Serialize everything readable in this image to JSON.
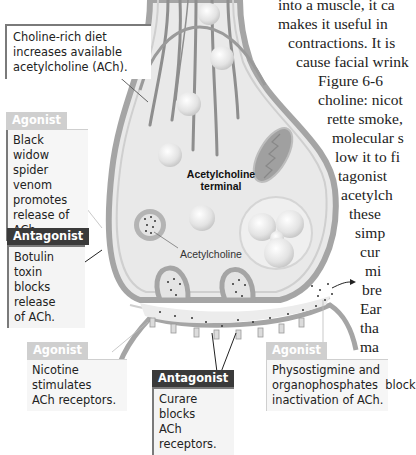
{
  "body_text": {
    "lines": [
      "into a muscle, it ca",
      "makes it useful in",
      "contractions. It is",
      "cause facial wrink",
      "Figure 6-6",
      "choline: nicot",
      "rette smoke,",
      "molecular s",
      "low it to fi",
      "tagonist",
      "acetylch",
      "these",
      "simp",
      "cur",
      "mi",
      "bre",
      "Ear",
      "tha",
      "ma"
    ]
  },
  "figure": {
    "terminal_label": "Acetylcholine terminal",
    "terminal_label_line1": "Acetylcholine",
    "terminal_label_line2": "terminal",
    "vesicle_label": "Acetylcholine",
    "colors": {
      "membrane": "#a9a9a9",
      "cytoplasm": "#e6e6e6",
      "mitochondria": "#9d9d9d",
      "antagonist_tag": "#3a3a3a",
      "agonist_tag": "#cfcfcf"
    }
  },
  "callouts": {
    "choline_diet": {
      "text": "Choline-rich diet increases available acetylcholine (ACh)."
    },
    "black_widow": {
      "tag": "Agonist",
      "line1": "Black widow",
      "line2": "spider venom",
      "line3": "promotes",
      "line4": "release of ACh."
    },
    "botulin": {
      "tag": "Antagonist",
      "line1": "Botulin toxin",
      "line2": "blocks release",
      "line3": "of ACh."
    },
    "nicotine": {
      "tag": "Agonist",
      "line1": "Nicotine stimulates",
      "line2": "ACh receptors."
    },
    "curare": {
      "tag": "Antagonist",
      "line1": "Curare blocks",
      "line2": "ACh receptors."
    },
    "physostigmine": {
      "tag": "Agonist",
      "line1": "Physostigmine and",
      "line2": "organophosphates  block",
      "line3": "inactivation of ACh."
    }
  }
}
